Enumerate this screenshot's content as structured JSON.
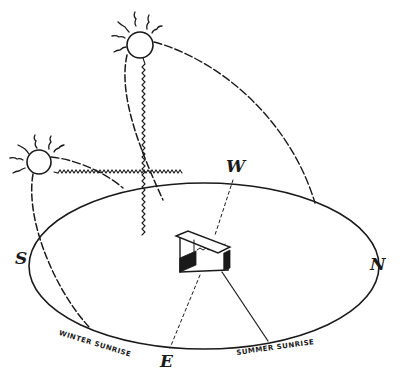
{
  "figure": {
    "colors": {
      "ink": "#1a1a1a",
      "background": "#ffffff"
    }
  },
  "compass": {
    "south": "S",
    "north": "N",
    "east": "E",
    "west": "W"
  },
  "labels": {
    "winter_sunrise": "WINTER SUNRISE",
    "summer_sunrise": "SUMMER SUNRISE"
  },
  "elements": {
    "summer_sun": "summer-sun-icon",
    "winter_sun": "winter-sun-icon",
    "building": "building-box-icon",
    "horizon": "horizon-ellipse"
  }
}
